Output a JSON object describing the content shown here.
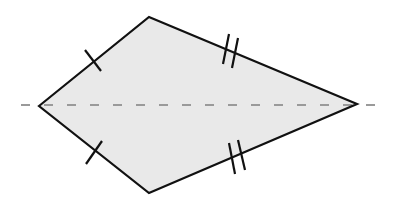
{
  "diagram": {
    "title": "Kite with line of symmetry",
    "shape": "kite",
    "fill_color": "#e9e9e9",
    "stroke_color": "#111111",
    "axis_color": "#9a9a9a",
    "vertices": {
      "left": [
        39,
        106
      ],
      "top": [
        149,
        17
      ],
      "right": [
        357,
        104
      ],
      "bottom": [
        149,
        193
      ]
    },
    "axis_of_symmetry": {
      "style": "dashed",
      "from": [
        21,
        105
      ],
      "to": [
        383,
        105
      ]
    },
    "tick_marks": [
      {
        "side": "left-top",
        "count": 1,
        "meaning": "equal short sides"
      },
      {
        "side": "left-bottom",
        "count": 1,
        "meaning": "equal short sides"
      },
      {
        "side": "top-right",
        "count": 2,
        "meaning": "equal long sides"
      },
      {
        "side": "bottom-right",
        "count": 2,
        "meaning": "equal long sides"
      }
    ]
  }
}
